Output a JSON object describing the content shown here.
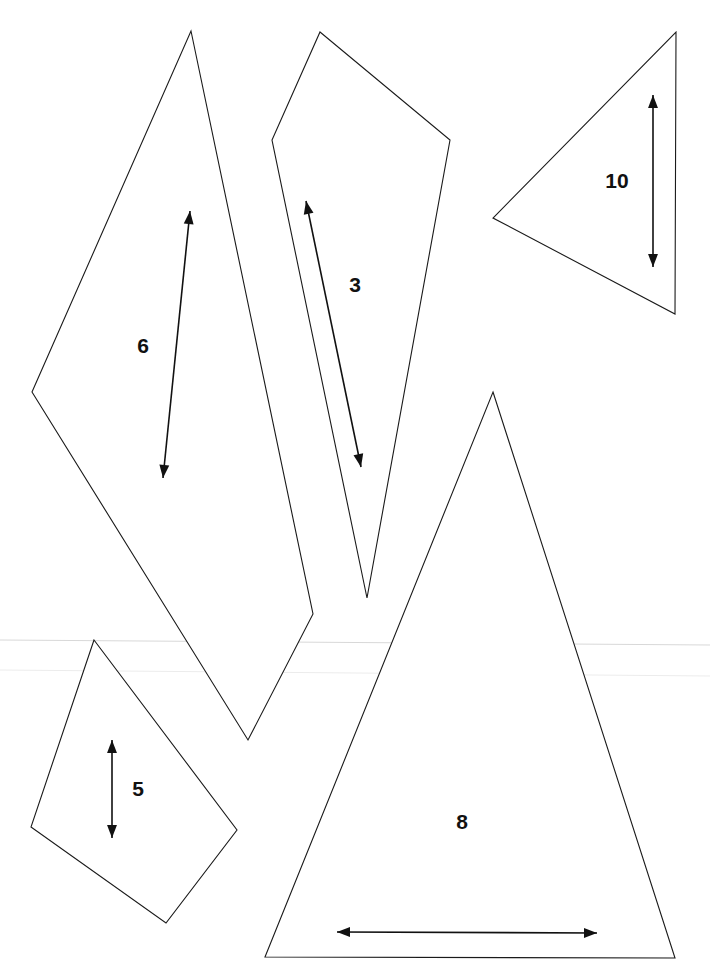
{
  "page": {
    "background": "#ffffff",
    "line_color": "#1a1a1a"
  },
  "pieces": [
    {
      "id": "6",
      "label": "6",
      "shape": "quadrilateral",
      "points": [
        [
          191,
          31
        ],
        [
          313,
          614
        ],
        [
          248,
          740
        ],
        [
          32,
          392
        ]
      ],
      "label_pos": [
        143,
        353
      ],
      "arrow": {
        "from": [
          163,
          478
        ],
        "to": [
          190,
          211
        ],
        "double_headed": true
      }
    },
    {
      "id": "3",
      "label": "3",
      "shape": "quadrilateral",
      "points": [
        [
          320,
          32
        ],
        [
          450,
          140
        ],
        [
          367,
          598
        ],
        [
          272,
          140
        ]
      ],
      "label_pos": [
        355,
        292
      ],
      "arrow": {
        "from": [
          306,
          201
        ],
        "to": [
          361,
          467
        ],
        "double_headed": true
      }
    },
    {
      "id": "10",
      "label": "10",
      "shape": "triangle",
      "points": [
        [
          676,
          32
        ],
        [
          675,
          314
        ],
        [
          493,
          218
        ]
      ],
      "label_pos": [
        617,
        188
      ],
      "arrow": {
        "from": [
          653,
          95
        ],
        "to": [
          653,
          267
        ],
        "double_headed": true
      }
    },
    {
      "id": "8",
      "label": "8",
      "shape": "triangle",
      "points": [
        [
          493,
          392
        ],
        [
          675,
          958
        ],
        [
          265,
          957
        ]
      ],
      "label_pos": [
        462,
        829
      ],
      "arrow": {
        "from": [
          337,
          932
        ],
        "to": [
          597,
          933
        ],
        "double_headed": true
      }
    },
    {
      "id": "5",
      "label": "5",
      "shape": "quadrilateral",
      "points": [
        [
          94,
          640
        ],
        [
          237,
          830
        ],
        [
          166,
          923
        ],
        [
          31,
          827
        ]
      ],
      "label_pos": [
        138,
        796
      ],
      "arrow": {
        "from": [
          112,
          740
        ],
        "to": [
          112,
          838
        ],
        "double_headed": true
      }
    }
  ],
  "scan_artifacts": [
    {
      "y1": 640,
      "y2": 645,
      "faint": false
    },
    {
      "y1": 670,
      "y2": 676,
      "faint": true
    }
  ]
}
